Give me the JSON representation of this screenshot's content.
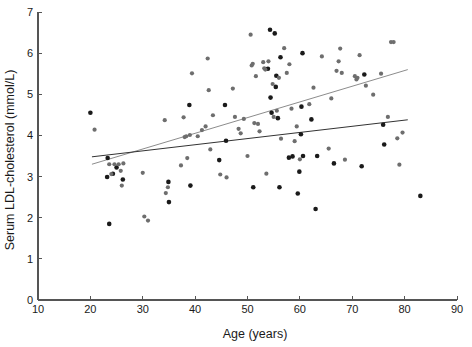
{
  "chart_data": {
    "type": "scatter",
    "title": "",
    "subtitle": "",
    "xlabel": "Age (years)",
    "ylabel": "Serum LDL-cholesterol  (mmol/L)",
    "xlim": [
      10,
      90
    ],
    "ylim": [
      0,
      7
    ],
    "xticks": [
      10,
      20,
      30,
      40,
      50,
      60,
      70,
      80,
      90
    ],
    "xtick_labels": [
      "10",
      "20",
      "30",
      "40",
      "50",
      "60",
      "70",
      "80",
      "90"
    ],
    "yticks": [
      0,
      1,
      2,
      3,
      4,
      5,
      6,
      7
    ],
    "ytick_labels": [
      "0",
      "1",
      "2",
      "3",
      "4",
      "5",
      "6",
      "7"
    ],
    "grid": false,
    "legend": "none",
    "annotations": [],
    "colors": {
      "series_dark": "#1a1a1a",
      "series_gray": "#6e6e6e",
      "axis": "#555555",
      "fitline_dark": "#333333",
      "fitline_gray": "#8c8c8c",
      "background": "#ffffff"
    },
    "series": [
      {
        "name": "Group A (dark points)",
        "color": "#1a1a1a",
        "marker": "circle",
        "marker_size": 4.6,
        "points": [
          [
            20.0,
            4.55
          ],
          [
            23.3,
            3.45
          ],
          [
            23.6,
            1.85
          ],
          [
            23.2,
            2.99
          ],
          [
            24.3,
            3.07
          ],
          [
            25.0,
            3.22
          ],
          [
            26.2,
            2.93
          ],
          [
            34.9,
            2.87
          ],
          [
            35.0,
            2.38
          ],
          [
            38.9,
            4.74
          ],
          [
            39.1,
            2.78
          ],
          [
            44.6,
            3.4
          ],
          [
            45.7,
            4.74
          ],
          [
            45.9,
            3.87
          ],
          [
            51.1,
            2.74
          ],
          [
            53.9,
            5.62
          ],
          [
            54.3,
            6.57
          ],
          [
            54.4,
            4.92
          ],
          [
            54.6,
            4.55
          ],
          [
            55.2,
            6.48
          ],
          [
            55.4,
            5.18
          ],
          [
            55.5,
            5.45
          ],
          [
            55.8,
            4.42
          ],
          [
            56.1,
            2.74
          ],
          [
            56.3,
            5.9
          ],
          [
            57.9,
            3.46
          ],
          [
            58.6,
            3.49
          ],
          [
            59.6,
            2.59
          ],
          [
            59.9,
            3.12
          ],
          [
            60.2,
            4.03
          ],
          [
            60.3,
            4.7
          ],
          [
            60.5,
            6.0
          ],
          [
            60.6,
            3.5
          ],
          [
            62.2,
            4.39
          ],
          [
            63.0,
            2.21
          ],
          [
            63.3,
            3.5
          ],
          [
            66.5,
            3.32
          ],
          [
            71.8,
            3.25
          ],
          [
            72.3,
            5.48
          ],
          [
            75.9,
            4.26
          ],
          [
            76.1,
            3.78
          ],
          [
            83.0,
            2.53
          ]
        ]
      },
      {
        "name": "Group B (gray points)",
        "color": "#6e6e6e",
        "marker": "circle",
        "marker_size": 4.2,
        "points": [
          [
            20.8,
            4.14
          ],
          [
            23.6,
            3.3
          ],
          [
            24.0,
            3.06
          ],
          [
            24.6,
            3.3
          ],
          [
            25.4,
            3.3
          ],
          [
            25.8,
            3.14
          ],
          [
            26.0,
            2.78
          ],
          [
            26.3,
            3.32
          ],
          [
            30.0,
            3.09
          ],
          [
            30.3,
            2.03
          ],
          [
            31.0,
            1.93
          ],
          [
            34.2,
            4.37
          ],
          [
            34.4,
            2.6
          ],
          [
            34.8,
            2.74
          ],
          [
            37.3,
            3.27
          ],
          [
            37.8,
            4.44
          ],
          [
            38.0,
            3.96
          ],
          [
            38.3,
            3.98
          ],
          [
            38.5,
            3.45
          ],
          [
            39.0,
            4.01
          ],
          [
            39.4,
            5.51
          ],
          [
            40.5,
            3.98
          ],
          [
            41.3,
            4.13
          ],
          [
            42.0,
            4.22
          ],
          [
            42.4,
            5.87
          ],
          [
            42.6,
            5.1
          ],
          [
            42.9,
            3.66
          ],
          [
            43.4,
            4.49
          ],
          [
            44.8,
            3.05
          ],
          [
            46.0,
            2.98
          ],
          [
            47.2,
            5.14
          ],
          [
            47.6,
            4.45
          ],
          [
            48.3,
            4.16
          ],
          [
            48.7,
            4.05
          ],
          [
            49.3,
            4.4
          ],
          [
            50.0,
            3.5
          ],
          [
            50.6,
            6.45
          ],
          [
            50.8,
            5.7
          ],
          [
            51.0,
            5.74
          ],
          [
            51.3,
            4.3
          ],
          [
            51.6,
            5.44
          ],
          [
            52.0,
            4.28
          ],
          [
            52.3,
            4.1
          ],
          [
            53.0,
            5.78
          ],
          [
            53.2,
            5.63
          ],
          [
            53.4,
            5.6
          ],
          [
            53.6,
            3.07
          ],
          [
            54.0,
            5.8
          ],
          [
            54.8,
            5.25
          ],
          [
            55.0,
            4.45
          ],
          [
            55.6,
            4.6
          ],
          [
            56.0,
            5.4
          ],
          [
            56.4,
            3.92
          ],
          [
            57.0,
            6.12
          ],
          [
            57.5,
            5.52
          ],
          [
            58.0,
            5.73
          ],
          [
            58.4,
            4.65
          ],
          [
            59.0,
            3.86
          ],
          [
            59.4,
            4.22
          ],
          [
            60.0,
            3.42
          ],
          [
            61.8,
            4.76
          ],
          [
            62.6,
            5.16
          ],
          [
            64.2,
            5.92
          ],
          [
            65.5,
            3.68
          ],
          [
            66.0,
            4.9
          ],
          [
            67.0,
            5.57
          ],
          [
            67.4,
            5.8
          ],
          [
            67.7,
            6.11
          ],
          [
            68.0,
            5.52
          ],
          [
            68.6,
            3.41
          ],
          [
            70.5,
            5.44
          ],
          [
            70.8,
            5.36
          ],
          [
            71.0,
            5.4
          ],
          [
            71.4,
            5.95
          ],
          [
            72.6,
            5.21
          ],
          [
            74.0,
            4.99
          ],
          [
            75.5,
            5.5
          ],
          [
            76.8,
            4.45
          ],
          [
            77.4,
            6.27
          ],
          [
            77.9,
            6.27
          ],
          [
            78.6,
            3.93
          ],
          [
            79.0,
            3.29
          ],
          [
            79.6,
            4.07
          ]
        ]
      }
    ],
    "fit_lines": [
      {
        "name": "regression-line-gray",
        "color": "#8c8c8c",
        "x0": 20.3,
        "y0": 3.3,
        "x1": 80.6,
        "y1": 5.6
      },
      {
        "name": "regression-line-dark",
        "color": "#333333",
        "x0": 20.3,
        "y0": 3.48,
        "x1": 80.6,
        "y1": 4.38
      }
    ]
  }
}
